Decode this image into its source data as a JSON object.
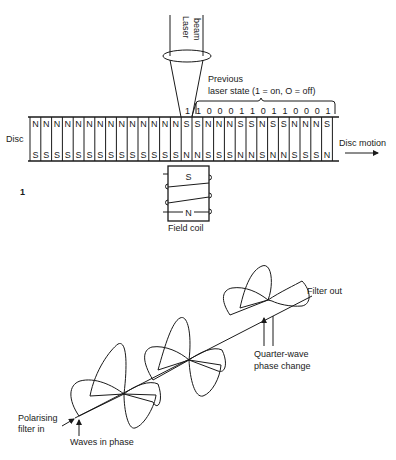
{
  "figure1": {
    "figure_number": "1",
    "laser_label_line1": "Laser",
    "laser_label_line2": "beam",
    "previous_state_line1": "Previous",
    "previous_state_line2": "laser state (1 = on, O = off)",
    "current_bit": "1",
    "previous_bits": [
      "1",
      "0",
      "0",
      "0",
      "1",
      "1",
      "0",
      "1",
      "1",
      "0",
      "0",
      "0",
      "1"
    ],
    "disc_label": "Disc",
    "disc_motion_label": "Disc motion",
    "top_row": [
      "N",
      "N",
      "N",
      "N",
      "N",
      "N",
      "N",
      "N",
      "N",
      "N",
      "N",
      "N",
      "N",
      "N",
      "S",
      "S",
      "N",
      "N",
      "N",
      "S",
      "S",
      "N",
      "S",
      "S",
      "N",
      "N",
      "N",
      "S"
    ],
    "bottom_row": [
      "S",
      "S",
      "S",
      "S",
      "S",
      "S",
      "S",
      "S",
      "S",
      "S",
      "S",
      "S",
      "S",
      "S",
      "N",
      "N",
      "S",
      "S",
      "S",
      "N",
      "N",
      "S",
      "N",
      "N",
      "S",
      "S",
      "S",
      "N"
    ],
    "coil_top_pole": "S",
    "coil_bottom_pole": "N",
    "coil_label": "Field coil"
  },
  "figure2": {
    "filter_out_label": "Filter out",
    "quarter_wave_line1": "Quarter-wave",
    "quarter_wave_line2": "phase change",
    "polarising_line1": "Polarising",
    "polarising_line2": "filter in",
    "waves_in_phase_label": "Waves in phase"
  }
}
